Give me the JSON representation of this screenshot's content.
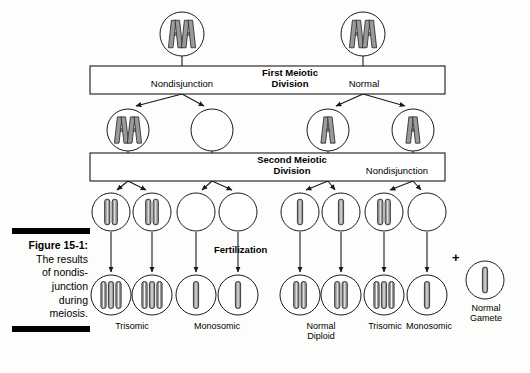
{
  "figure": {
    "number_label": "Figure 15-1:",
    "caption_lines": [
      "The results",
      "of nondis-",
      "junction",
      "during",
      "meiosis."
    ],
    "caption_full": "Figure 15-1: The results of nondisjunction during meiosis."
  },
  "bars": {
    "first": {
      "title_line1": "First Meiotic",
      "title_line2": "Division"
    },
    "second": {
      "title_line1": "Second Meiotic",
      "title_line2": "Division"
    }
  },
  "labels": {
    "nondisjunction_first": "Nondisjunction",
    "normal_first": "Normal",
    "nondisjunction_second": "Nondisjunction",
    "fertilization": "Fertilization",
    "plus_sign": "+",
    "normal_gamete_line1": "Normal",
    "normal_gamete_line2": "Gamete"
  },
  "outcomes": [
    {
      "name": "trisomic-left",
      "line1": "Trisomic",
      "line2": ""
    },
    {
      "name": "monosomic-left",
      "line1": "Monosomic",
      "line2": ""
    },
    {
      "name": "normal-diploid",
      "line1": "Normal",
      "line2": "Diploid"
    },
    {
      "name": "trisomic-right",
      "line1": "Trisomic",
      "line2": ""
    },
    {
      "name": "monosomic-right",
      "line1": "Monosomic",
      "line2": ""
    }
  ],
  "colors": {
    "stroke": "#1a1a1a",
    "chromosome_fill": "#9a9a9a",
    "chromosome_edge": "#2b2b2b",
    "bar_fill": "#ffffff",
    "background": "#fdfdfc",
    "caption_rule": "#000000"
  },
  "diagram": {
    "type": "meiosis-nondisjunction-flowchart",
    "rows": [
      {
        "name": "parent-cells",
        "cells": [
          {
            "id": "parent-left",
            "x": 182,
            "y": 34,
            "r": 22,
            "chromosomes": "2X",
            "count": 2,
            "shape": "duplicated"
          },
          {
            "id": "parent-right",
            "x": 363,
            "y": 34,
            "r": 22,
            "chromosomes": "2X",
            "count": 2,
            "shape": "duplicated"
          }
        ]
      },
      {
        "name": "after-meiosis-1",
        "cells": [
          {
            "id": "m1-c1",
            "x": 128,
            "y": 130,
            "r": 21,
            "chromosomes": "2X",
            "count": 2,
            "shape": "duplicated"
          },
          {
            "id": "m1-c2",
            "x": 212,
            "y": 130,
            "r": 21,
            "chromosomes": "none",
            "count": 0,
            "shape": "empty"
          },
          {
            "id": "m1-c3",
            "x": 328,
            "y": 130,
            "r": 21,
            "chromosomes": "1X",
            "count": 1,
            "shape": "duplicated"
          },
          {
            "id": "m1-c4",
            "x": 413,
            "y": 130,
            "r": 21,
            "chromosomes": "1X",
            "count": 1,
            "shape": "duplicated"
          }
        ]
      },
      {
        "name": "gametes",
        "cells": [
          {
            "id": "g1",
            "x": 111,
            "y": 212,
            "r": 19,
            "chromosomes": "2 rods",
            "count": 2,
            "shape": "single"
          },
          {
            "id": "g2",
            "x": 152,
            "y": 212,
            "r": 19,
            "chromosomes": "2 rods",
            "count": 2,
            "shape": "single"
          },
          {
            "id": "g3",
            "x": 196,
            "y": 212,
            "r": 19,
            "chromosomes": "none",
            "count": 0,
            "shape": "empty"
          },
          {
            "id": "g4",
            "x": 238,
            "y": 212,
            "r": 19,
            "chromosomes": "none",
            "count": 0,
            "shape": "empty"
          },
          {
            "id": "g5",
            "x": 300,
            "y": 212,
            "r": 19,
            "chromosomes": "1 rod",
            "count": 1,
            "shape": "single"
          },
          {
            "id": "g6",
            "x": 341,
            "y": 212,
            "r": 19,
            "chromosomes": "1 rod",
            "count": 1,
            "shape": "single"
          },
          {
            "id": "g7",
            "x": 384,
            "y": 212,
            "r": 19,
            "chromosomes": "2 rods",
            "count": 2,
            "shape": "single"
          },
          {
            "id": "g8",
            "x": 427,
            "y": 212,
            "r": 19,
            "chromosomes": "none",
            "count": 0,
            "shape": "empty"
          }
        ]
      },
      {
        "name": "normal-gamete",
        "cells": [
          {
            "id": "normal-gamete",
            "x": 485,
            "y": 280,
            "r": 19,
            "chromosomes": "1 rod",
            "count": 1,
            "shape": "single"
          }
        ]
      },
      {
        "name": "zygotes",
        "cells": [
          {
            "id": "z1",
            "x": 111,
            "y": 295,
            "r": 20,
            "chromosomes": "3 rods",
            "count": 3,
            "shape": "single"
          },
          {
            "id": "z2",
            "x": 152,
            "y": 295,
            "r": 20,
            "chromosomes": "3 rods",
            "count": 3,
            "shape": "single"
          },
          {
            "id": "z3",
            "x": 196,
            "y": 295,
            "r": 20,
            "chromosomes": "1 rod",
            "count": 1,
            "shape": "single"
          },
          {
            "id": "z4",
            "x": 238,
            "y": 295,
            "r": 20,
            "chromosomes": "1 rod",
            "count": 1,
            "shape": "single"
          },
          {
            "id": "z5",
            "x": 300,
            "y": 295,
            "r": 20,
            "chromosomes": "2 rods",
            "count": 2,
            "shape": "single"
          },
          {
            "id": "z6",
            "x": 341,
            "y": 295,
            "r": 20,
            "chromosomes": "2 rods",
            "count": 2,
            "shape": "single"
          },
          {
            "id": "z7",
            "x": 384,
            "y": 295,
            "r": 20,
            "chromosomes": "3 rods",
            "count": 3,
            "shape": "single"
          },
          {
            "id": "z8",
            "x": 427,
            "y": 295,
            "r": 20,
            "chromosomes": "1 rod",
            "count": 1,
            "shape": "single"
          }
        ]
      }
    ]
  }
}
